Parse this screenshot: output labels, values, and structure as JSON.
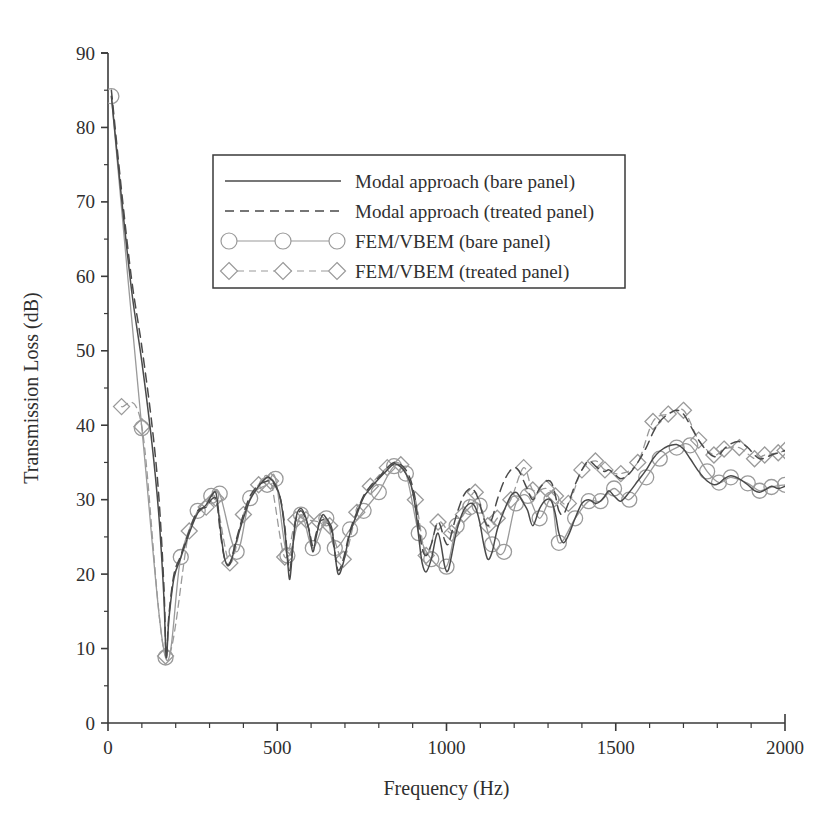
{
  "chart_data": {
    "type": "line",
    "title": "",
    "xlabel": "Frequency (Hz)",
    "ylabel": "Transmission Loss (dB)",
    "xlim": [
      0,
      2000
    ],
    "ylim": [
      0,
      90
    ],
    "xticks": [
      0,
      500,
      1000,
      1500,
      2000
    ],
    "xtick_labels": [
      "0",
      "500",
      "1000",
      "1500",
      "2000"
    ],
    "xminor_step": 100,
    "yticks": [
      0,
      10,
      20,
      30,
      40,
      50,
      60,
      70,
      80,
      90
    ],
    "ytick_labels": [
      "0",
      "10",
      "20",
      "30",
      "40",
      "50",
      "60",
      "70",
      "80",
      "90"
    ],
    "yminor_step": 5,
    "grid": false,
    "legend_position": "upper-center",
    "series": [
      {
        "name": "Modal approach (bare panel)",
        "style": "solid",
        "color": "#4a4a4a",
        "marker": "none",
        "x": [
          10,
          40,
          70,
          100,
          130,
          150,
          165,
          172,
          180,
          195,
          215,
          240,
          265,
          290,
          305,
          318,
          325,
          332,
          345,
          360,
          380,
          400,
          420,
          445,
          470,
          480,
          495,
          510,
          522,
          530,
          537,
          545,
          555,
          570,
          585,
          595,
          605,
          615,
          625,
          635,
          645,
          655,
          662,
          670,
          680,
          695,
          715,
          735,
          755,
          775,
          800,
          825,
          845,
          865,
          880,
          895,
          908,
          918,
          928,
          940,
          955,
          975,
          995,
          1005,
          1015,
          1030,
          1050,
          1070,
          1085,
          1098,
          1110,
          1122,
          1135,
          1150,
          1170,
          1190,
          1205,
          1215,
          1228,
          1240,
          1255,
          1275,
          1295,
          1310,
          1322,
          1332,
          1345,
          1360,
          1380,
          1400,
          1420,
          1440,
          1455,
          1468,
          1480,
          1495,
          1515,
          1540,
          1565,
          1590,
          1610,
          1630,
          1655,
          1680,
          1700,
          1720,
          1745,
          1770,
          1790,
          1805,
          1820,
          1840,
          1865,
          1890,
          1910,
          1925,
          1940,
          1960,
          1980,
          2000
        ],
        "y": [
          84.2,
          70.5,
          58.0,
          48.5,
          37.5,
          28.0,
          17.0,
          8.8,
          14.0,
          19.5,
          22.2,
          25.5,
          28.2,
          29.3,
          30.5,
          31.0,
          29.0,
          26.0,
          22.0,
          21.3,
          24.5,
          27.5,
          30.0,
          31.8,
          33.0,
          32.8,
          32.0,
          30.0,
          26.0,
          22.0,
          19.3,
          23.0,
          27.5,
          28.8,
          27.5,
          25.5,
          23.0,
          25.0,
          27.0,
          28.0,
          27.5,
          26.8,
          26.0,
          23.0,
          20.0,
          21.5,
          25.5,
          28.0,
          30.3,
          31.5,
          32.8,
          34.0,
          34.8,
          34.4,
          33.5,
          32.0,
          29.0,
          25.0,
          21.5,
          20.3,
          22.0,
          25.5,
          21.0,
          20.5,
          22.5,
          25.8,
          28.5,
          29.5,
          29.0,
          27.0,
          24.0,
          22.0,
          23.0,
          26.0,
          28.5,
          30.5,
          31.0,
          30.5,
          29.5,
          28.5,
          26.5,
          28.8,
          30.0,
          29.8,
          28.0,
          25.5,
          24.2,
          25.2,
          27.5,
          29.5,
          30.0,
          29.5,
          29.8,
          30.5,
          31.2,
          30.5,
          29.8,
          31.0,
          32.5,
          34.0,
          35.5,
          36.5,
          37.2,
          37.4,
          36.8,
          35.5,
          33.8,
          32.5,
          32.0,
          32.2,
          32.8,
          33.2,
          32.8,
          32.0,
          31.2,
          31.0,
          31.3,
          31.8,
          31.5,
          31.8
        ]
      },
      {
        "name": "Modal approach (treated panel)",
        "style": "dashed",
        "color": "#4a4a4a",
        "marker": "none",
        "x": [
          10,
          40,
          70,
          100,
          130,
          150,
          165,
          172,
          180,
          195,
          215,
          240,
          265,
          290,
          305,
          318,
          325,
          332,
          345,
          360,
          380,
          400,
          420,
          445,
          470,
          480,
          495,
          510,
          522,
          530,
          537,
          545,
          555,
          570,
          585,
          595,
          605,
          615,
          625,
          635,
          645,
          655,
          662,
          670,
          680,
          695,
          715,
          735,
          755,
          775,
          800,
          825,
          845,
          865,
          880,
          895,
          908,
          918,
          928,
          940,
          955,
          975,
          995,
          1005,
          1015,
          1030,
          1050,
          1070,
          1085,
          1098,
          1110,
          1122,
          1135,
          1150,
          1170,
          1190,
          1205,
          1215,
          1228,
          1240,
          1255,
          1275,
          1295,
          1310,
          1322,
          1332,
          1345,
          1360,
          1380,
          1400,
          1420,
          1440,
          1455,
          1468,
          1480,
          1495,
          1515,
          1540,
          1565,
          1590,
          1610,
          1630,
          1655,
          1680,
          1700,
          1720,
          1745,
          1770,
          1790,
          1805,
          1820,
          1840,
          1865,
          1890,
          1910,
          1925,
          1940,
          1960,
          1980,
          2000
        ],
        "y": [
          85.0,
          71.5,
          59.5,
          50.5,
          40.0,
          30.5,
          18.5,
          9.0,
          14.5,
          20.0,
          22.5,
          25.8,
          28.5,
          29.0,
          30.0,
          30.2,
          28.5,
          25.5,
          22.0,
          21.5,
          24.8,
          28.0,
          30.5,
          32.0,
          32.5,
          32.5,
          31.8,
          30.0,
          26.5,
          22.5,
          20.5,
          23.5,
          27.3,
          28.5,
          27.3,
          25.8,
          23.8,
          25.5,
          27.0,
          27.3,
          27.0,
          26.5,
          25.5,
          23.0,
          20.5,
          22.0,
          25.8,
          28.3,
          30.5,
          31.8,
          33.0,
          34.3,
          35.0,
          34.7,
          34.0,
          32.5,
          30.0,
          26.5,
          23.5,
          22.5,
          24.0,
          27.0,
          24.5,
          24.0,
          25.5,
          28.0,
          30.5,
          31.5,
          31.0,
          29.5,
          27.5,
          26.5,
          27.5,
          30.0,
          32.5,
          34.0,
          34.3,
          33.8,
          32.5,
          31.3,
          30.0,
          31.5,
          32.5,
          32.3,
          30.5,
          28.5,
          28.0,
          29.5,
          32.0,
          34.0,
          35.2,
          34.5,
          34.0,
          33.8,
          34.0,
          33.5,
          32.8,
          33.5,
          35.0,
          37.0,
          39.0,
          40.5,
          41.5,
          42.0,
          41.5,
          40.0,
          38.0,
          36.5,
          35.8,
          36.0,
          36.8,
          37.5,
          37.8,
          37.0,
          36.0,
          35.5,
          35.6,
          36.0,
          36.3,
          36.6
        ]
      },
      {
        "name": "FEM/VBEM (bare panel)",
        "style": "solid",
        "color": "#9a9a9a",
        "marker": "circle",
        "x": [
          10,
          100,
          170,
          215,
          265,
          305,
          330,
          380,
          420,
          470,
          495,
          530,
          570,
          605,
          645,
          670,
          715,
          755,
          800,
          845,
          880,
          918,
          955,
          1000,
          1030,
          1070,
          1098,
          1135,
          1170,
          1205,
          1240,
          1275,
          1310,
          1332,
          1380,
          1420,
          1455,
          1495,
          1540,
          1590,
          1630,
          1680,
          1720,
          1770,
          1805,
          1840,
          1890,
          1925,
          1960,
          2000
        ],
        "y": [
          84.2,
          39.6,
          8.8,
          22.3,
          28.5,
          30.5,
          30.8,
          23.0,
          30.2,
          32.0,
          32.8,
          22.5,
          28.0,
          23.5,
          27.5,
          23.5,
          26.0,
          28.5,
          31.0,
          34.5,
          33.5,
          25.5,
          22.0,
          21.0,
          26.5,
          29.0,
          29.2,
          24.0,
          23.0,
          29.5,
          30.5,
          27.5,
          30.0,
          24.2,
          27.5,
          29.8,
          29.8,
          31.5,
          30.0,
          33.0,
          35.5,
          37.0,
          37.3,
          33.8,
          32.3,
          33.0,
          32.2,
          31.2,
          31.7,
          32.0
        ]
      },
      {
        "name": "FEM/VBEM (treated panel)",
        "style": "dashed",
        "color": "#9a9a9a",
        "marker": "diamond",
        "x": [
          40,
          100,
          170,
          240,
          290,
          318,
          360,
          400,
          445,
          480,
          522,
          555,
          585,
          625,
          655,
          695,
          735,
          775,
          825,
          865,
          908,
          940,
          975,
          1015,
          1050,
          1085,
          1122,
          1150,
          1190,
          1228,
          1255,
          1295,
          1322,
          1360,
          1400,
          1440,
          1468,
          1515,
          1565,
          1610,
          1655,
          1700,
          1745,
          1790,
          1820,
          1865,
          1910,
          1940,
          1980,
          2000
        ],
        "y": [
          42.5,
          39.8,
          9.0,
          25.8,
          29.0,
          30.2,
          21.5,
          28.0,
          32.0,
          32.5,
          22.3,
          27.3,
          27.3,
          27.0,
          26.5,
          22.0,
          28.3,
          31.8,
          34.3,
          34.7,
          30.0,
          22.5,
          27.0,
          25.5,
          28.0,
          31.0,
          26.5,
          27.5,
          30.0,
          34.3,
          31.3,
          31.5,
          30.5,
          29.5,
          34.0,
          35.2,
          34.0,
          33.5,
          35.0,
          40.5,
          41.5,
          42.0,
          38.0,
          36.0,
          36.8,
          37.0,
          35.5,
          36.0,
          36.3,
          36.6
        ]
      }
    ]
  },
  "legend": {
    "entries": [
      {
        "label": "Modal approach (bare panel)",
        "style": "solid",
        "marker": "none",
        "color": "#4a4a4a"
      },
      {
        "label": "Modal approach (treated panel)",
        "style": "dashed",
        "marker": "none",
        "color": "#4a4a4a"
      },
      {
        "label": "FEM/VBEM (bare panel)",
        "style": "solid",
        "marker": "circle",
        "color": "#9a9a9a"
      },
      {
        "label": "FEM/VBEM (treated panel)",
        "style": "dashed",
        "marker": "diamond",
        "color": "#9a9a9a"
      }
    ]
  }
}
